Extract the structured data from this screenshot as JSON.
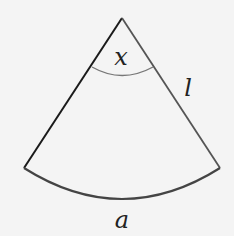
{
  "diagram": {
    "type": "circular-sector",
    "labels": {
      "angle": "x",
      "radius": "l",
      "arc": "a"
    },
    "colors": {
      "background": "#f4f4f4",
      "stroke_left": "#1a1a1a",
      "stroke_right": "#555555",
      "angle_arc": "#777777",
      "text": "#222222"
    }
  }
}
